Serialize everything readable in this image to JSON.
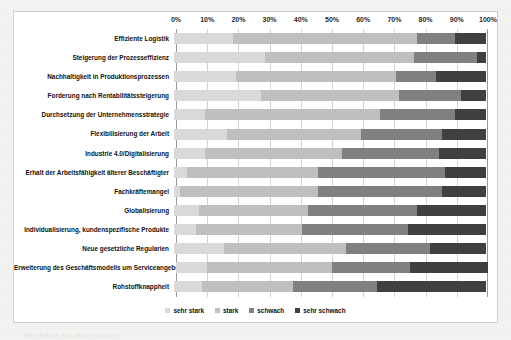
{
  "background_text": [
    {
      "text": "bei in in ne anzuwähl be das er die sie gruppe",
      "x": 38,
      "y": 24
    },
    {
      "text": "mit dem der  mann er eine dieser",
      "x": 20,
      "y": 46
    },
    {
      "text": "Teilnehmer die ziele sein bereich",
      "x": 26,
      "y": 66
    },
    {
      "text": "ser",
      "x": 22,
      "y": 114
    },
    {
      "text": "550",
      "x": 34,
      "y": 196
    },
    {
      "text": "der beim an den ein mit",
      "x": 24,
      "y": 330
    }
  ],
  "chart_data": {
    "type": "bar",
    "orientation": "horizontal",
    "stacked": true,
    "stack_mode": "percent",
    "title": "",
    "xlabel": "",
    "ylabel": "",
    "xlim": [
      0,
      100
    ],
    "xticks": [
      "0%",
      "10%",
      "20%",
      "30%",
      "40%",
      "50%",
      "60%",
      "70%",
      "80%",
      "90%",
      "100%"
    ],
    "xtick_values": [
      0,
      10,
      20,
      30,
      40,
      50,
      60,
      70,
      80,
      90,
      100
    ],
    "grid": true,
    "legend_position": "bottom",
    "categories": [
      "Effiziente Logistik",
      "Steigerung der Prozesseffizienz",
      "Nachhaltigkeit in Produktionsprozessen",
      "Forderung nach Rentabilitätssteigerung",
      "Durchsetzung der Unternehmensstrategie",
      "Flexibilisierung der Arbeit",
      "Industrie 4.0/Digitalisierung",
      "Erhalt der Arbeitsfähigkeit älterer Beschäftigter",
      "Fachkräftemangel",
      "Globalisierung",
      "Individualisierung, kundenspezifische Produkte",
      "Neue gesetzliche Regularien",
      "Erweiterung des Geschäftsmodells um Serviceangebote",
      "Rohstoffknappheit"
    ],
    "series": [
      {
        "name": "sehr stark",
        "color": "#d9d9d9",
        "values": [
          19,
          29,
          20,
          28,
          10,
          17,
          10,
          4,
          2,
          8,
          7,
          16,
          10,
          9
        ]
      },
      {
        "name": "stark",
        "color": "#bfbfbf",
        "values": [
          59,
          48,
          51,
          44,
          56,
          43,
          44,
          42,
          44,
          35,
          34,
          39,
          40,
          29
        ]
      },
      {
        "name": "schwach",
        "color": "#808080",
        "values": [
          12,
          20,
          13,
          20,
          24,
          26,
          31,
          41,
          40,
          35,
          34,
          27,
          25,
          27
        ]
      },
      {
        "name": "sehr schwach",
        "color": "#404040",
        "values": [
          10,
          3,
          16,
          8,
          10,
          14,
          15,
          13,
          14,
          22,
          25,
          18,
          25,
          35
        ]
      }
    ]
  }
}
